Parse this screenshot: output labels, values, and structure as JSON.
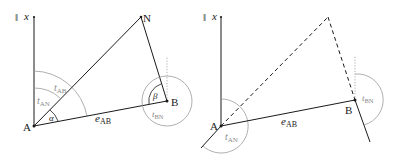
{
  "figures": [
    {
      "id": "left",
      "axis_label": "x",
      "axis_marker": "‖",
      "points": {
        "A": {
          "label": "A"
        },
        "B": {
          "label": "B"
        },
        "N": {
          "label": "N"
        }
      },
      "labels": {
        "t_AB": {
          "base": "t",
          "sub": "AB"
        },
        "t_AN": {
          "base": "t",
          "sub": "AN"
        },
        "t_BN": {
          "base": "t",
          "sub": "BN"
        },
        "e_AB": {
          "base": "e",
          "sub": "AB"
        },
        "alpha": "α",
        "beta": "β"
      }
    },
    {
      "id": "right",
      "axis_label": "x",
      "axis_marker": "‖",
      "points": {
        "A": {
          "label": "A"
        },
        "B": {
          "label": "B"
        }
      },
      "labels": {
        "t_AN": {
          "base": "t",
          "sub": "AN"
        },
        "t_BN": {
          "base": "t",
          "sub": "BN"
        },
        "e_AB": {
          "base": "e",
          "sub": "AB"
        }
      }
    }
  ],
  "colors": {
    "line": "#1a1a1a",
    "arc": "#9a9a9a",
    "arc_label": "#8a8a8a"
  }
}
